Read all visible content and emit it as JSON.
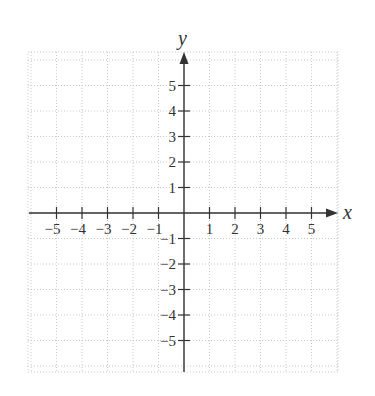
{
  "chart_data": {
    "type": "scatter",
    "title": "",
    "xlabel": "x",
    "ylabel": "y",
    "xlim": [
      -6,
      6
    ],
    "ylim": [
      -6,
      6
    ],
    "grid": true,
    "grid_style": "dotted",
    "x_ticks": [
      -5,
      -4,
      -3,
      -2,
      -1,
      1,
      2,
      3,
      4,
      5
    ],
    "y_ticks": [
      -5,
      -4,
      -3,
      -2,
      -1,
      1,
      2,
      3,
      4,
      5
    ],
    "x_tick_labels": [
      "−5",
      "−4",
      "−3",
      "−2",
      "−1",
      "1",
      "2",
      "3",
      "4",
      "5"
    ],
    "y_tick_labels": [
      "−5",
      "−4",
      "−3",
      "−2",
      "−1",
      "1",
      "2",
      "3",
      "4",
      "5"
    ],
    "series": []
  },
  "labels": {
    "x_axis": "x",
    "y_axis": "y"
  },
  "colors": {
    "axis": "#333333",
    "grid": "#c8c8c8",
    "text": "#333333"
  }
}
